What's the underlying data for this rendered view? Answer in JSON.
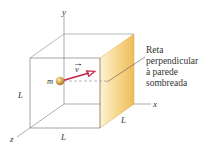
{
  "diagram": {
    "axes": {
      "x_label": "x",
      "y_label": "y",
      "z_label": "z"
    },
    "edge_labels": {
      "left": "L",
      "bottom": "L",
      "depth": "L"
    },
    "particle": {
      "mass_label": "m",
      "velocity_label": "v",
      "color": "#c9953f"
    },
    "arrow_color": "#c0274a",
    "shaded_wall_colors": [
      "#fdf1cf",
      "#f0c064"
    ],
    "annotation": {
      "lines": [
        "Reta",
        "perpendicular",
        "à parede",
        "sombreada"
      ]
    }
  }
}
